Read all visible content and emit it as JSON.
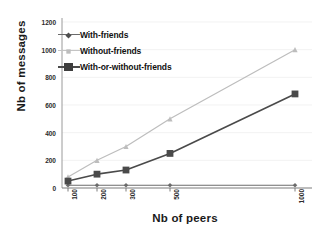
{
  "chart_data": {
    "type": "line",
    "title": "",
    "xlabel": "Nb of peers",
    "ylabel": "Nb of messages",
    "categories": [
      "100",
      "200",
      "300",
      "500",
      "1000"
    ],
    "ylim": [
      0,
      1200
    ],
    "yticks": [
      0,
      200,
      400,
      600,
      800,
      1000,
      1200
    ],
    "grid": true,
    "legend_position": "upper left inside",
    "series": [
      {
        "name": "With-friends",
        "color": "#6b6b6b",
        "marker": "diamond",
        "values": [
          20,
          20,
          20,
          20,
          20
        ]
      },
      {
        "name": "Without-friends",
        "color": "#bdbdbd",
        "marker": "triangle",
        "values": [
          80,
          200,
          300,
          500,
          1000
        ]
      },
      {
        "name": "With-or-without-friends",
        "color": "#4a4a4a",
        "marker": "square",
        "values": [
          50,
          100,
          130,
          250,
          680
        ]
      }
    ]
  },
  "axes": {
    "ylabel_text": "Nb of messages",
    "xlabel_text": "Nb of peers",
    "ytick_labels": [
      "0",
      "200",
      "400",
      "600",
      "800",
      "1000",
      "1200"
    ],
    "xtick_labels": [
      "100",
      "200",
      "300",
      "500",
      "1000"
    ]
  },
  "legend": {
    "items": [
      {
        "label": "With-friends"
      },
      {
        "label": "Without-friends"
      },
      {
        "label": "With-or-without-friends"
      }
    ]
  },
  "colors": {
    "series_with_friends": "#6b6b6b",
    "series_without_friends": "#bdbdbd",
    "series_with_or_without": "#4a4a4a",
    "axis": "#8a8a8a",
    "grid": "#ededed",
    "text": "#1a1a1a",
    "background": "#ffffff"
  }
}
